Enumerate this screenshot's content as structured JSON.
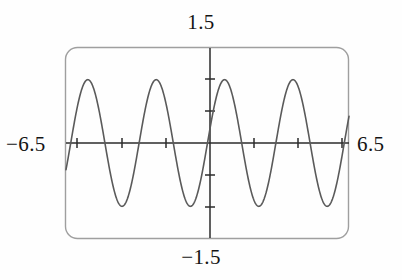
{
  "device": {
    "name": "graphing-calculator-screen",
    "frame_color": "#9a9a9a",
    "screen_background": "#fefefe"
  },
  "labels": {
    "y_max": "1.5",
    "y_min": "−1.5",
    "x_min": "−6.5",
    "x_max": "6.5"
  },
  "chart_data": {
    "type": "line",
    "title": "",
    "xlabel": "",
    "ylabel": "",
    "xlim": [
      -6.5,
      6.5
    ],
    "ylim": [
      -1.5,
      1.5
    ],
    "grid": false,
    "legend": null,
    "axis_color": "#2b2b2b",
    "curve_color": "#5a5a5a",
    "x_tick_values": [
      -6.0,
      -4.0,
      -2.0,
      2.0,
      4.0,
      6.0
    ],
    "y_tick_values": [
      -1.0,
      -0.5,
      0.5,
      1.0
    ],
    "x_tick_labels": [
      "",
      "",
      "",
      "",
      "",
      ""
    ],
    "y_tick_labels": [
      "",
      "",
      "",
      ""
    ],
    "series": [
      {
        "name": "y = sin(2x)",
        "expression": "sin(2x)",
        "amplitude": 1.0,
        "period": 3.14159,
        "x": [
          -6.5,
          -6.25,
          -6.0,
          -5.75,
          -5.5,
          -5.25,
          -5.0,
          -4.75,
          -4.5,
          -4.25,
          -4.0,
          -3.75,
          -3.5,
          -3.25,
          -3.0,
          -2.75,
          -2.5,
          -2.25,
          -2.0,
          -1.75,
          -1.5,
          -1.25,
          -1.0,
          -0.75,
          -0.5,
          -0.25,
          0.0,
          0.25,
          0.5,
          0.75,
          1.0,
          1.25,
          1.5,
          1.75,
          2.0,
          2.25,
          2.5,
          2.75,
          3.0,
          3.25,
          3.5,
          3.75,
          4.0,
          4.25,
          4.5,
          4.75,
          5.0,
          5.25,
          5.5,
          5.75,
          6.0,
          6.25,
          6.5
        ],
        "y": [
          -0.22,
          0.25,
          0.66,
          0.93,
          1.0,
          0.87,
          0.54,
          0.09,
          -0.41,
          -0.79,
          -0.99,
          -0.95,
          -0.68,
          -0.26,
          0.28,
          0.71,
          0.96,
          0.98,
          0.76,
          0.35,
          -0.14,
          -0.6,
          -0.91,
          -1.0,
          -0.84,
          -0.48,
          0.0,
          0.48,
          0.84,
          1.0,
          0.91,
          0.6,
          0.14,
          -0.35,
          -0.76,
          -0.98,
          -0.96,
          -0.71,
          -0.28,
          0.26,
          0.68,
          0.95,
          0.99,
          0.79,
          0.41,
          -0.09,
          -0.54,
          -0.87,
          -1.0,
          -0.93,
          -0.66,
          -0.25,
          0.22
        ]
      }
    ],
    "zeros_visible": [
      -6.28,
      -4.71,
      -3.14,
      -1.57,
      0.0,
      1.57,
      3.14,
      4.71,
      6.28
    ],
    "maxima_visible": [
      {
        "x": -5.5,
        "y": 1.0
      },
      {
        "x": -2.36,
        "y": 1.0
      },
      {
        "x": 0.79,
        "y": 1.0
      },
      {
        "x": 3.93,
        "y": 1.0
      }
    ],
    "minima_visible": [
      {
        "x": -3.93,
        "y": -1.0
      },
      {
        "x": -0.79,
        "y": -1.0
      },
      {
        "x": 2.36,
        "y": -1.0
      },
      {
        "x": 5.5,
        "y": -1.0
      }
    ]
  }
}
